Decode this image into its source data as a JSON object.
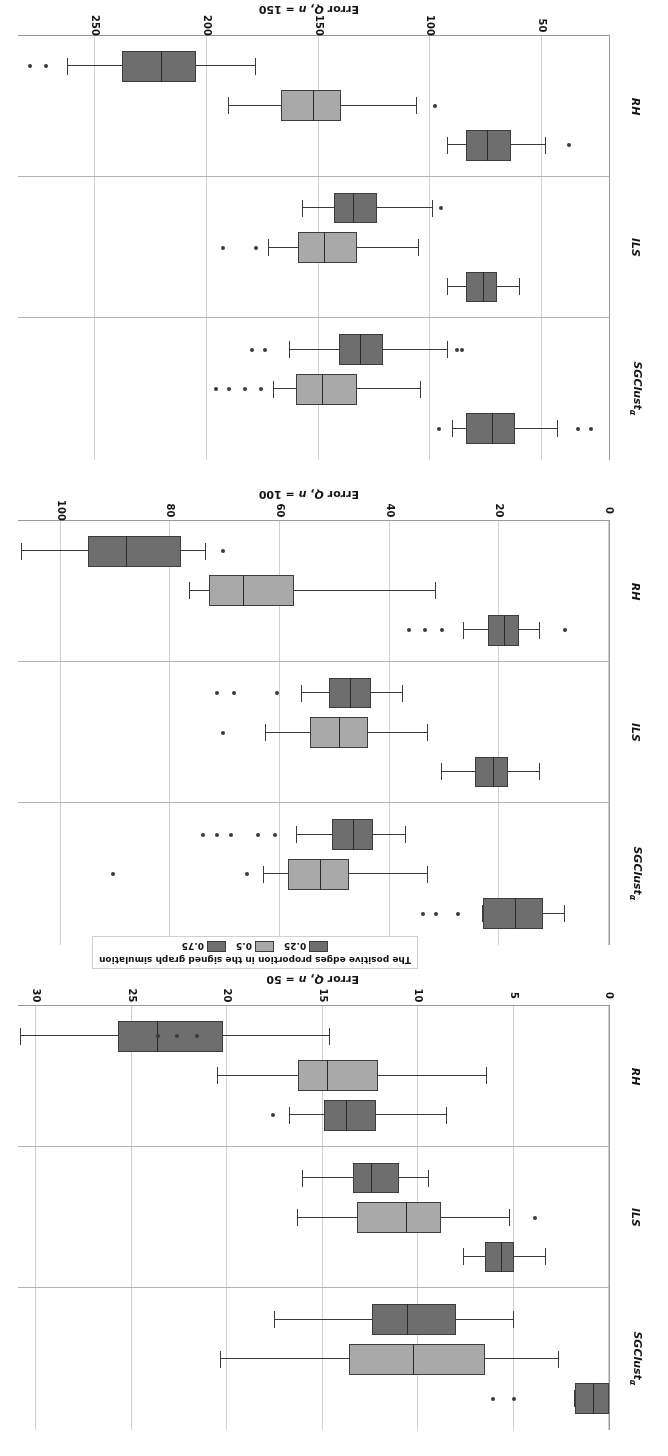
{
  "figure": {
    "rotation_degrees": 180,
    "background": "#ffffff"
  },
  "legend": {
    "title": "The positive edges proportion in the signed graph simulation",
    "items": [
      {
        "label": "0.25",
        "color": "#6e6e6e"
      },
      {
        "label": "0.5",
        "color": "#a9a9a9"
      },
      {
        "label": "0.75",
        "color": "#6e6e6e"
      }
    ]
  },
  "categories": [
    "SGClustα",
    "ILS",
    "RH"
  ],
  "chart_data": {
    "type": "box",
    "title": "",
    "orientation": "horizontal",
    "grid": true,
    "legend_position": "top-center",
    "group_variable": "The positive edges proportion in the signed graph simulation",
    "groups": [
      "0.25",
      "0.5",
      "0.75"
    ],
    "group_colors": [
      "#6e6e6e",
      "#a9a9a9",
      "#6e6e6e"
    ],
    "categories": [
      "SGClustα",
      "ILS",
      "RH"
    ],
    "panels": [
      {
        "id": "n50",
        "xlabel": "Error Q, n = 50",
        "xlim": [
          0,
          31
        ],
        "ticks": [
          0,
          5,
          10,
          15,
          20,
          25,
          30
        ],
        "ticklabels": [
          "0",
          "5",
          "10",
          "15",
          "20",
          "25",
          "30"
        ],
        "boxes": [
          {
            "category": "SGClustα",
            "group": "0.75",
            "color": "#6e6e6e",
            "whisker_low": 0.0,
            "q1": 0.0,
            "median": 0.8,
            "q3": 1.8,
            "whisker_high": 1.8,
            "outliers": [
              5.0,
              6.1
            ]
          },
          {
            "category": "SGClustα",
            "group": "0.5",
            "color": "#a9a9a9",
            "whisker_low": 2.6,
            "q1": 6.5,
            "median": 10.2,
            "q3": 13.6,
            "whisker_high": 20.3,
            "outliers": []
          },
          {
            "category": "SGClustα",
            "group": "0.25",
            "color": "#6e6e6e",
            "whisker_low": 5.0,
            "q1": 8.0,
            "median": 10.5,
            "q3": 12.4,
            "whisker_high": 17.5,
            "outliers": []
          },
          {
            "category": "ILS",
            "group": "0.75",
            "color": "#6e6e6e",
            "whisker_low": 3.3,
            "q1": 5.0,
            "median": 5.6,
            "q3": 6.5,
            "whisker_high": 7.6,
            "outliers": []
          },
          {
            "category": "ILS",
            "group": "0.5",
            "color": "#a9a9a9",
            "whisker_low": 5.2,
            "q1": 8.8,
            "median": 10.6,
            "q3": 13.2,
            "whisker_high": 16.3,
            "outliers": [
              3.9
            ]
          },
          {
            "category": "ILS",
            "group": "0.25",
            "color": "#6e6e6e",
            "whisker_low": 9.4,
            "q1": 11.0,
            "median": 12.4,
            "q3": 13.4,
            "whisker_high": 16.0,
            "outliers": []
          },
          {
            "category": "RH",
            "group": "0.75",
            "color": "#6e6e6e",
            "whisker_low": 8.5,
            "q1": 12.2,
            "median": 13.7,
            "q3": 14.9,
            "whisker_high": 16.7,
            "outliers": [
              17.6
            ]
          },
          {
            "category": "RH",
            "group": "0.5",
            "color": "#a9a9a9",
            "whisker_low": 6.4,
            "q1": 12.1,
            "median": 14.7,
            "q3": 16.3,
            "whisker_high": 20.5,
            "outliers": []
          },
          {
            "category": "RH",
            "group": "0.25",
            "color": "#6e6e6e",
            "whisker_low": 14.6,
            "q1": 20.2,
            "median": 23.6,
            "q3": 25.7,
            "whisker_high": 30.8,
            "outliers": [
              21.6,
              22.6,
              23.6
            ]
          }
        ]
      },
      {
        "id": "n100",
        "xlabel": "Error Q, n = 100",
        "xlim": [
          0,
          108
        ],
        "ticks": [
          0,
          20,
          40,
          60,
          80,
          100
        ],
        "ticklabels": [
          "0",
          "20",
          "40",
          "60",
          "80",
          "100"
        ],
        "boxes": [
          {
            "category": "SGClustα",
            "group": "0.75",
            "color": "#6e6e6e",
            "whisker_low": 8.0,
            "q1": 12.0,
            "median": 17.0,
            "q3": 23.0,
            "whisker_high": 23.0,
            "outliers": [
              27.5,
              31.5,
              34.0
            ]
          },
          {
            "category": "SGClustα",
            "group": "0.5",
            "color": "#a9a9a9",
            "whisker_low": 33.0,
            "q1": 47.5,
            "median": 52.5,
            "q3": 58.5,
            "whisker_high": 63.0,
            "outliers": [
              66.0,
              90.5
            ]
          },
          {
            "category": "SGClustα",
            "group": "0.25",
            "color": "#6e6e6e",
            "whisker_low": 37.0,
            "q1": 43.0,
            "median": 46.5,
            "q3": 50.5,
            "whisker_high": 57.0,
            "outliers": [
              61.0,
              64.0,
              69.0,
              71.5,
              74.0
            ]
          },
          {
            "category": "ILS",
            "group": "0.75",
            "color": "#6e6e6e",
            "whisker_low": 12.5,
            "q1": 18.5,
            "median": 21.0,
            "q3": 24.5,
            "whisker_high": 30.5,
            "outliers": []
          },
          {
            "category": "ILS",
            "group": "0.5",
            "color": "#a9a9a9",
            "whisker_low": 33.0,
            "q1": 44.0,
            "median": 49.0,
            "q3": 54.5,
            "whisker_high": 62.5,
            "outliers": [
              70.5
            ]
          },
          {
            "category": "ILS",
            "group": "0.25",
            "color": "#6e6e6e",
            "whisker_low": 37.5,
            "q1": 43.5,
            "median": 47.0,
            "q3": 51.0,
            "whisker_high": 56.0,
            "outliers": [
              60.5,
              68.5,
              71.5
            ]
          },
          {
            "category": "RH",
            "group": "0.75",
            "color": "#6e6e6e",
            "whisker_low": 12.5,
            "q1": 16.5,
            "median": 19.0,
            "q3": 22.0,
            "whisker_high": 26.5,
            "outliers": [
              8.0,
              30.5,
              33.5,
              36.5
            ]
          },
          {
            "category": "RH",
            "group": "0.5",
            "color": "#a9a9a9",
            "whisker_low": 31.5,
            "q1": 57.5,
            "median": 66.5,
            "q3": 73.0,
            "whisker_high": 76.5,
            "outliers": []
          },
          {
            "category": "RH",
            "group": "0.25",
            "color": "#6e6e6e",
            "whisker_low": 73.5,
            "q1": 78.0,
            "median": 88.0,
            "q3": 95.0,
            "whisker_high": 107.0,
            "outliers": [
              70.5
            ]
          }
        ]
      },
      {
        "id": "n150",
        "xlabel": "Error Q, n = 150",
        "xlim": [
          20,
          285
        ],
        "ticks": [
          50,
          100,
          150,
          200,
          250
        ],
        "ticklabels": [
          "50",
          "100",
          "150",
          "200",
          "250"
        ],
        "boxes": [
          {
            "category": "SGClustα",
            "group": "0.75",
            "color": "#6e6e6e",
            "whisker_low": 43.0,
            "q1": 62.0,
            "median": 72.0,
            "q3": 84.0,
            "whisker_high": 90.0,
            "outliers": [
              28.0,
              34.0,
              96.0
            ]
          },
          {
            "category": "SGClustα",
            "group": "0.5",
            "color": "#a9a9a9",
            "whisker_low": 104.0,
            "q1": 133.0,
            "median": 148.0,
            "q3": 160.0,
            "whisker_high": 170.0,
            "outliers": [
              176.0,
              183.0,
              190.0,
              196.0
            ]
          },
          {
            "category": "SGClustα",
            "group": "0.25",
            "color": "#6e6e6e",
            "whisker_low": 92.0,
            "q1": 121.0,
            "median": 131.0,
            "q3": 141.0,
            "whisker_high": 163.0,
            "outliers": [
              86.0,
              88.0,
              174.0,
              180.0
            ]
          },
          {
            "category": "ILS",
            "group": "0.75",
            "color": "#6e6e6e",
            "whisker_low": 60.0,
            "q1": 70.0,
            "median": 76.0,
            "q3": 84.0,
            "whisker_high": 92.0,
            "outliers": []
          },
          {
            "category": "ILS",
            "group": "0.5",
            "color": "#a9a9a9",
            "whisker_low": 105.0,
            "q1": 133.0,
            "median": 147.0,
            "q3": 159.0,
            "whisker_high": 172.0,
            "outliers": [
              178.0,
              193.0
            ]
          },
          {
            "category": "ILS",
            "group": "0.25",
            "color": "#6e6e6e",
            "whisker_low": 99.0,
            "q1": 124.0,
            "median": 134.0,
            "q3": 143.0,
            "whisker_high": 157.0,
            "outliers": [
              95.0
            ]
          },
          {
            "category": "RH",
            "group": "0.75",
            "color": "#6e6e6e",
            "whisker_low": 48.0,
            "q1": 64.0,
            "median": 74.0,
            "q3": 84.0,
            "whisker_high": 92.0,
            "outliers": [
              38.0
            ]
          },
          {
            "category": "RH",
            "group": "0.5",
            "color": "#a9a9a9",
            "whisker_low": 106.0,
            "q1": 140.0,
            "median": 152.0,
            "q3": 167.0,
            "whisker_high": 190.0,
            "outliers": [
              98.0
            ]
          },
          {
            "category": "RH",
            "group": "0.25",
            "color": "#6e6e6e",
            "whisker_low": 178.0,
            "q1": 205.0,
            "median": 220.0,
            "q3": 238.0,
            "whisker_high": 262.0,
            "outliers": [
              272.0,
              279.0
            ]
          }
        ]
      }
    ]
  }
}
